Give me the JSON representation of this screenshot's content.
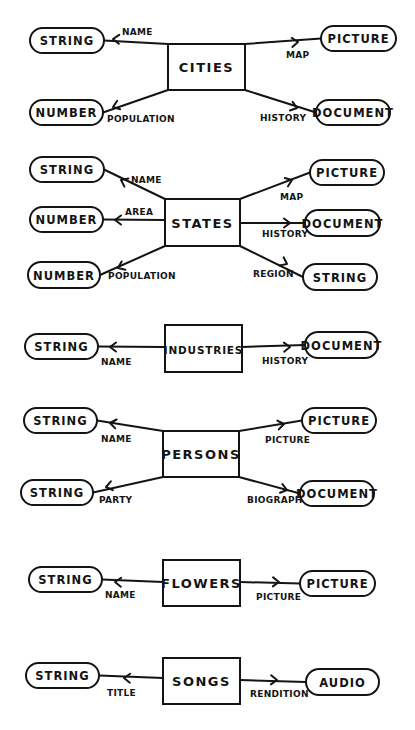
{
  "diagram": {
    "type": "entity-attribute diagram (hand drawn)",
    "ink_color": "#141414",
    "background": "#ffffff",
    "entities": [
      {
        "name": "CITIES",
        "box": [
          168,
          44,
          77,
          46
        ],
        "attributes": [
          {
            "relation": "NAME",
            "type": "STRING",
            "side": "left",
            "pill": [
              30,
              28,
              74,
              25
            ],
            "from": [
              168,
              44
            ],
            "arrow_at": [
              113,
              39
            ],
            "label_pos": [
              122,
              35
            ],
            "label_anchor": "start"
          },
          {
            "relation": "POPULATION",
            "type": "NUMBER",
            "side": "left",
            "pill": [
              30,
              100,
              73,
              25
            ],
            "from": [
              168,
              90
            ],
            "arrow_at": [
              113,
              107
            ],
            "label_pos": [
              107,
              122
            ],
            "label_anchor": "start"
          },
          {
            "relation": "MAP",
            "type": "PICTURE",
            "side": "right",
            "pill": [
              321,
              26,
              75,
              25
            ],
            "from": [
              245,
              44
            ],
            "arrow_at": [
              298,
              42
            ],
            "label_pos": [
              286,
              58
            ],
            "label_anchor": "start"
          },
          {
            "relation": "HISTORY",
            "type": "DOCUMENT",
            "side": "right",
            "pill": [
              316,
              100,
              74,
              25
            ],
            "from": [
              245,
              90
            ],
            "arrow_at": [
              297,
              108
            ],
            "label_pos": [
              260,
              121
            ],
            "label_anchor": "start"
          }
        ]
      },
      {
        "name": "STATES",
        "box": [
          165,
          199,
          75,
          47
        ],
        "attributes": [
          {
            "relation": "NAME",
            "type": "STRING",
            "side": "left",
            "pill": [
              30,
              157,
              74,
              25
            ],
            "from": [
              165,
              199
            ],
            "arrow_at": [
              121,
              180
            ],
            "label_pos": [
              131,
              183
            ],
            "label_anchor": "start"
          },
          {
            "relation": "AREA",
            "type": "NUMBER",
            "side": "left",
            "pill": [
              30,
              207,
              73,
              25
            ],
            "from": [
              165,
              220
            ],
            "arrow_at": [
              115,
              220
            ],
            "label_pos": [
              125,
              215
            ],
            "label_anchor": "start"
          },
          {
            "relation": "POPULATION",
            "type": "NUMBER",
            "side": "left",
            "pill": [
              28,
              262,
              72,
              26
            ],
            "from": [
              165,
              246
            ],
            "arrow_at": [
              118,
              268
            ],
            "label_pos": [
              108,
              279
            ],
            "label_anchor": "start"
          },
          {
            "relation": "MAP",
            "type": "PICTURE",
            "side": "right",
            "pill": [
              310,
              160,
              74,
              25
            ],
            "from": [
              240,
              199
            ],
            "arrow_at": [
              292,
              180
            ],
            "label_pos": [
              280,
              200
            ],
            "label_anchor": "start"
          },
          {
            "relation": "HISTORY",
            "type": "DOCUMENT",
            "side": "right",
            "pill": [
              305,
              210,
              75,
              26
            ],
            "from": [
              240,
              223
            ],
            "arrow_at": [
              290,
              223
            ],
            "label_pos": [
              262,
              237
            ],
            "label_anchor": "start"
          },
          {
            "relation": "REGION",
            "type": "STRING",
            "side": "right",
            "pill": [
              303,
              264,
              74,
              26
            ],
            "from": [
              240,
              246
            ],
            "arrow_at": [
              287,
              264
            ],
            "label_pos": [
              253,
              277
            ],
            "label_anchor": "start"
          }
        ]
      },
      {
        "name": "INDUSTRIES",
        "box": [
          165,
          325,
          77,
          47
        ],
        "attributes": [
          {
            "relation": "NAME",
            "type": "STRING",
            "side": "left",
            "pill": [
              25,
              334,
              73,
              25
            ],
            "from": [
              165,
              347
            ],
            "arrow_at": [
              110,
              347
            ],
            "label_pos": [
              101,
              365
            ],
            "label_anchor": "start"
          },
          {
            "relation": "HISTORY",
            "type": "DOCUMENT",
            "side": "right",
            "pill": [
              305,
              332,
              73,
              26
            ],
            "from": [
              242,
              347
            ],
            "arrow_at": [
              290,
              347
            ],
            "label_pos": [
              262,
              364
            ],
            "label_anchor": "start"
          }
        ]
      },
      {
        "name": "PERSONS",
        "box": [
          163,
          431,
          76,
          46
        ],
        "attributes": [
          {
            "relation": "NAME",
            "type": "STRING",
            "side": "left",
            "pill": [
              24,
              408,
              73,
              25
            ],
            "from": [
              163,
              431
            ],
            "arrow_at": [
              110,
              423
            ],
            "label_pos": [
              101,
              442
            ],
            "label_anchor": "start"
          },
          {
            "relation": "PARTY",
            "type": "STRING",
            "side": "left",
            "pill": [
              21,
              480,
              72,
              25
            ],
            "from": [
              163,
              477
            ],
            "arrow_at": [
              106,
              487
            ],
            "label_pos": [
              99,
              503
            ],
            "label_anchor": "start"
          },
          {
            "relation": "PICTURE",
            "type": "PICTURE",
            "side": "right",
            "pill": [
              302,
              408,
              74,
              25
            ],
            "from": [
              239,
              431
            ],
            "arrow_at": [
              284,
              424
            ],
            "label_pos": [
              265,
              443
            ],
            "label_anchor": "start"
          },
          {
            "relation": "BIOGRAPHY",
            "type": "DOCUMENT",
            "side": "right",
            "pill": [
              300,
              481,
              74,
              25
            ],
            "from": [
              239,
              477
            ],
            "arrow_at": [
              287,
              490
            ],
            "label_pos": [
              247,
              503
            ],
            "label_anchor": "start"
          }
        ]
      },
      {
        "name": "FLOWERS",
        "box": [
          163,
          560,
          77,
          46
        ],
        "attributes": [
          {
            "relation": "NAME",
            "type": "STRING",
            "side": "left",
            "pill": [
              29,
              567,
              73,
              25
            ],
            "from": [
              163,
              582
            ],
            "arrow_at": [
              115,
              582
            ],
            "label_pos": [
              105,
              598
            ],
            "label_anchor": "start"
          },
          {
            "relation": "PICTURE",
            "type": "PICTURE",
            "side": "right",
            "pill": [
              300,
              571,
              75,
              25
            ],
            "from": [
              240,
              582
            ],
            "arrow_at": [
              279,
              582
            ],
            "label_pos": [
              256,
              600
            ],
            "label_anchor": "start"
          }
        ]
      },
      {
        "name": "SONGS",
        "box": [
          163,
          658,
          77,
          46
        ],
        "attributes": [
          {
            "relation": "TITLE",
            "type": "STRING",
            "side": "left",
            "pill": [
              26,
              663,
              73,
              25
            ],
            "from": [
              163,
              678
            ],
            "arrow_at": [
              124,
              678
            ],
            "label_pos": [
              107,
              696
            ],
            "label_anchor": "start"
          },
          {
            "relation": "RENDITION",
            "type": "AUDIO",
            "side": "right",
            "pill": [
              306,
              669,
              73,
              26
            ],
            "from": [
              240,
              680
            ],
            "arrow_at": [
              277,
              680
            ],
            "label_pos": [
              250,
              697
            ],
            "label_anchor": "start"
          }
        ]
      }
    ]
  }
}
